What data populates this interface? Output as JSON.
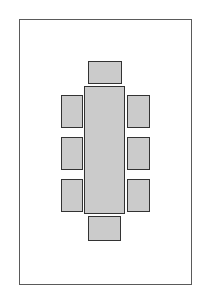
{
  "diagram": {
    "title": "Dining table seating plan",
    "colors": {
      "background": "#ffffff",
      "room_border": "#5a5a5a",
      "furniture_fill": "#cbcbcb",
      "furniture_border": "#333333"
    },
    "room": {
      "label": "room-outline",
      "x": 19,
      "y": 19,
      "w": 173,
      "h": 266
    },
    "table": {
      "label": "table",
      "x": 84,
      "y": 86,
      "w": 41,
      "h": 128
    },
    "chairs": [
      {
        "label": "chair-head",
        "x": 88,
        "y": 61,
        "w": 34,
        "h": 23
      },
      {
        "label": "chair-left-1",
        "x": 61,
        "y": 95,
        "w": 22,
        "h": 33
      },
      {
        "label": "chair-left-2",
        "x": 61,
        "y": 137,
        "w": 22,
        "h": 33
      },
      {
        "label": "chair-left-3",
        "x": 61,
        "y": 179,
        "w": 22,
        "h": 33
      },
      {
        "label": "chair-right-1",
        "x": 127,
        "y": 95,
        "w": 23,
        "h": 33
      },
      {
        "label": "chair-right-2",
        "x": 127,
        "y": 137,
        "w": 23,
        "h": 33
      },
      {
        "label": "chair-right-3",
        "x": 127,
        "y": 179,
        "w": 23,
        "h": 33
      },
      {
        "label": "chair-foot",
        "x": 88,
        "y": 216,
        "w": 33,
        "h": 25
      }
    ]
  }
}
